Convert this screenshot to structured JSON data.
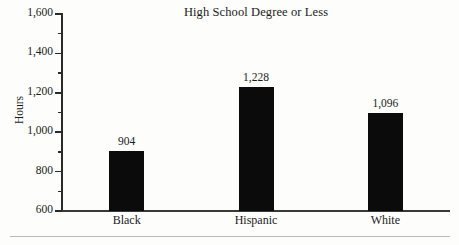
{
  "chart_data": {
    "type": "bar",
    "title": "High School Degree or Less",
    "xlabel": "",
    "ylabel": "Hours",
    "categories": [
      "Black",
      "Hispanic",
      "White"
    ],
    "values": [
      904,
      1228,
      1096
    ],
    "value_labels": [
      "904",
      "1,228",
      "1,096"
    ],
    "ylim": [
      600,
      1600
    ],
    "y_ticks": [
      600,
      800,
      1000,
      1200,
      1400,
      1600
    ],
    "y_tick_labels": [
      "600",
      "800",
      "1,000",
      "1,200",
      "1,400",
      "1,600"
    ],
    "y_minor_ticks": [
      700,
      900,
      1100,
      1300,
      1500
    ],
    "grid": false,
    "legend": null,
    "bar_color": "#0b0b0b",
    "axis_color": "#2a2a2a",
    "background_color": "#fdfdfb"
  },
  "figure": {
    "bottom_rule_color": "#b9b9b9"
  }
}
